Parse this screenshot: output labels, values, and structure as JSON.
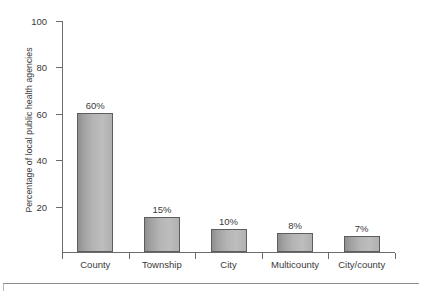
{
  "chart_data": {
    "type": "bar",
    "title": "",
    "subtitle": "",
    "xlabel": "",
    "ylabel": "Percentage of local public health agencies",
    "categories": [
      "County",
      "Township",
      "City",
      "Multicounty",
      "City/county"
    ],
    "values": [
      60,
      15,
      10,
      8,
      7
    ],
    "value_labels": [
      "60%",
      "15%",
      "10%",
      "8%",
      "7%"
    ],
    "ylim": [
      0,
      100
    ],
    "yticks": [
      0,
      20,
      40,
      60,
      80,
      100
    ],
    "ytick_labels": [
      "",
      "20",
      "40",
      "60",
      "80",
      "100"
    ],
    "grid": false,
    "legend": null,
    "annotations": [],
    "series": [
      {
        "name": "Percentage of local public health agencies",
        "values": [
          60,
          15,
          10,
          8,
          7
        ]
      }
    ],
    "colors": {
      "bar_fill_dark": "#8f8f8f",
      "bar_fill_light": "#bdbdbd",
      "bar_border": "#5d5d5d",
      "axis": "#6b6b6b",
      "text": "#3a3a3a",
      "background": "#ffffff"
    }
  }
}
